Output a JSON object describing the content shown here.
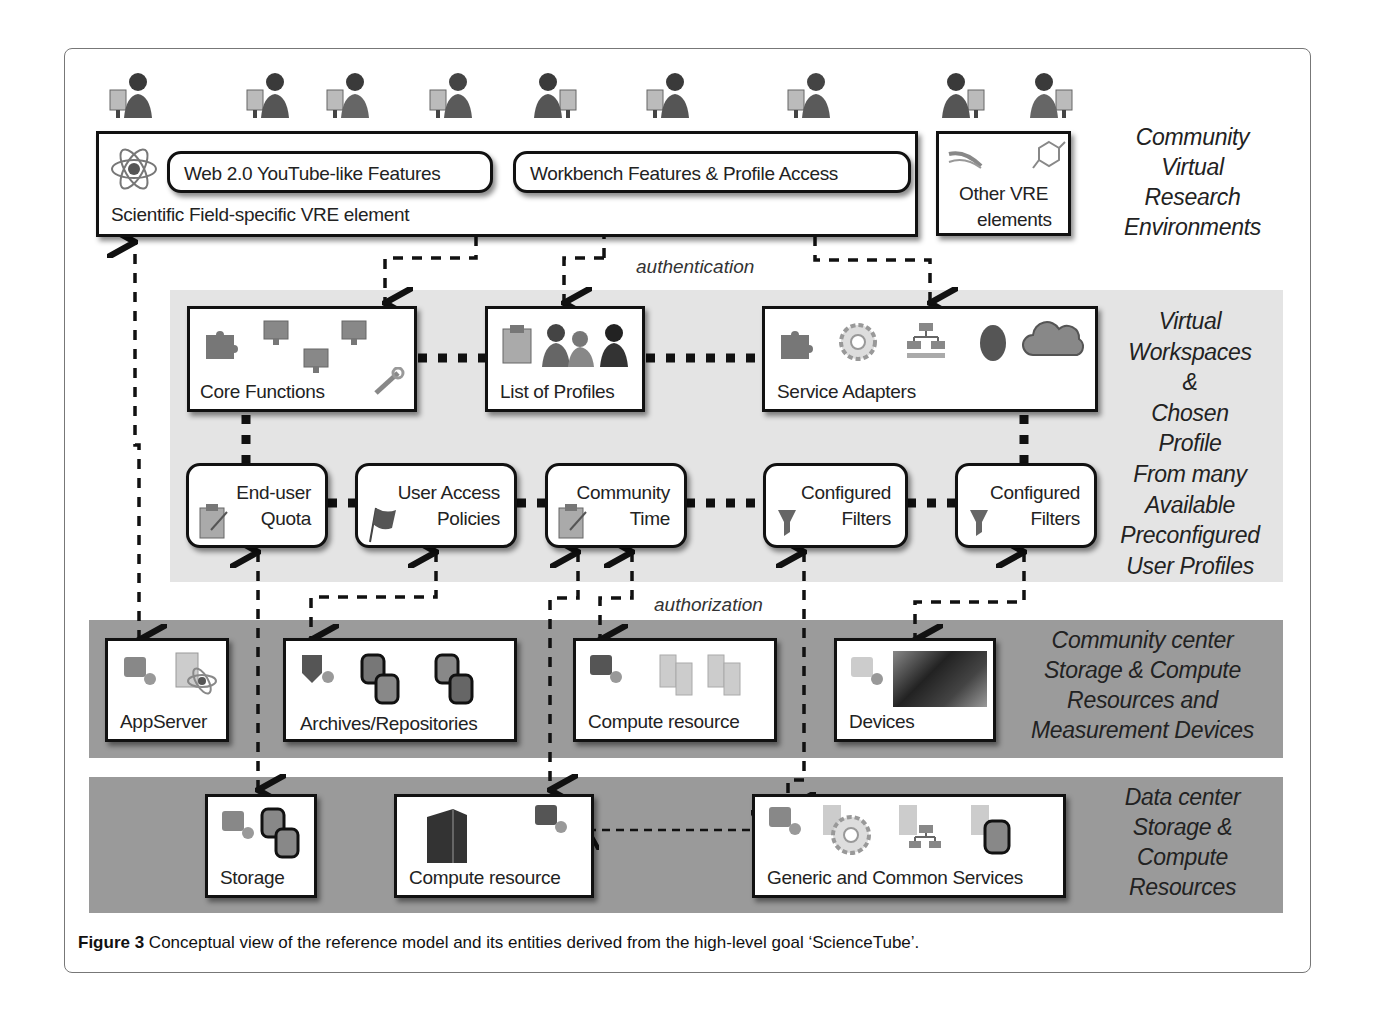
{
  "caption": {
    "figure_label": "Figure 3",
    "text": " Conceptual view of the reference model and its entities derived from the high-level goal ‘ScienceTube’."
  },
  "layers": {
    "community_vre": {
      "side_label": [
        "Community",
        "Virtual",
        "Research",
        "Environments"
      ],
      "users_count": 9,
      "main_box": {
        "label": "Scientific Field-specific VRE element",
        "icon": "atom-icon",
        "sub_boxes": [
          {
            "label": "Web 2.0 YouTube-like Features"
          },
          {
            "label": "Workbench Features & Profile Access"
          }
        ]
      },
      "other_box": {
        "label_line1": "Other VRE",
        "label_line2": "elements",
        "icons": [
          "dna-icon",
          "molecule-icon"
        ]
      }
    },
    "virtual_workspaces": {
      "side_label": [
        "Virtual",
        "Workspaces",
        "&",
        "Chosen",
        "Profile",
        "From many",
        "Available",
        "Preconfigured",
        "User Profiles"
      ],
      "top_row": [
        {
          "label": "Core Functions",
          "icons": [
            "puzzle-icon",
            "monitor-icon",
            "monitor-icon",
            "monitor-icon",
            "tools-icon"
          ]
        },
        {
          "label": "List of Profiles",
          "icons": [
            "clipboard-icon",
            "users-icon"
          ]
        },
        {
          "label": "Service Adapters",
          "icons": [
            "puzzle-icon",
            "gear-icon",
            "network-icon",
            "egg-icon",
            "cloud-icon"
          ]
        }
      ],
      "bottom_row": [
        {
          "line1": "End-user",
          "line2": "Quota",
          "icon": "clipboard-icon"
        },
        {
          "line1": "User Access",
          "line2": "Policies",
          "icon": "flag-icon"
        },
        {
          "line1": "Community",
          "line2": "Time",
          "icon": "clipboard-icon"
        },
        {
          "line1": "Configured",
          "line2": "Filters",
          "icon": "funnel-icon"
        },
        {
          "line1": "Configured",
          "line2": "Filters",
          "icon": "funnel-icon"
        }
      ]
    },
    "community_center": {
      "side_label": [
        "Community center",
        "Storage & Compute",
        "Resources and",
        "Measurement Devices"
      ],
      "boxes": [
        {
          "label": "AppServer"
        },
        {
          "label": "Archives/Repositories"
        },
        {
          "label": "Compute resource"
        },
        {
          "label": "Devices"
        }
      ]
    },
    "data_center": {
      "side_label": [
        "Data center",
        "Storage &",
        "Compute",
        "Resources"
      ],
      "boxes": [
        {
          "label": "Storage"
        },
        {
          "label": "Compute resource"
        },
        {
          "label": "Generic and Common Services"
        }
      ]
    }
  },
  "connectors": {
    "authentication_label": "authentication",
    "authorization_label": "authorization"
  },
  "colors": {
    "band_light": "#e4e4e4",
    "band_mid": "#9b9b9b",
    "band_dark": "#9a9a9a",
    "box_border": "#111111"
  }
}
